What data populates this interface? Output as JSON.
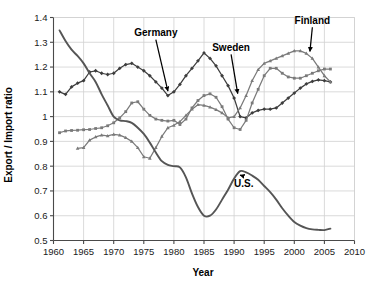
{
  "chart_data": {
    "type": "line",
    "title": "",
    "xlabel": "Year",
    "ylabel": "Export / Import ratio",
    "xlim": [
      1960,
      2010
    ],
    "ylim": [
      0.5,
      1.4
    ],
    "xticks": [
      1960,
      1965,
      1970,
      1975,
      1980,
      1985,
      1990,
      1995,
      2000,
      2005,
      2010
    ],
    "yticks": [
      0.5,
      0.6,
      0.7,
      0.8,
      0.9,
      1.0,
      1.1,
      1.2,
      1.3,
      1.4
    ],
    "xtick_labels": [
      "1960",
      "1965",
      "1970",
      "1975",
      "1980",
      "1985",
      "1990",
      "1995",
      "2000",
      "2005",
      "2010"
    ],
    "ytick_labels": [
      "0.5",
      "0.6",
      "0.7",
      "0.8",
      "0.9",
      "1",
      "1.1",
      "1.2",
      "1.3",
      "1.4"
    ],
    "grid": true,
    "legend_position": "none",
    "annotations": [
      {
        "label": "Germany",
        "x": 1979,
        "y": 1.085,
        "label_x": 1977.0,
        "label_y": 1.325
      },
      {
        "label": "Sweden",
        "x": 1990.6,
        "y": 1.075,
        "label_x": 1989.5,
        "label_y": 1.265
      },
      {
        "label": "Finland",
        "x": 2002.6,
        "y": 1.245,
        "label_x": 2003.0,
        "label_y": 1.375
      },
      {
        "label": "U.S.",
        "x": 1991.0,
        "y": 0.782,
        "label_x": 1991.6,
        "label_y": 0.715
      }
    ],
    "series": [
      {
        "name": "Germany",
        "color": "#3d3d3d",
        "marker": "diamond",
        "x": [
          1961,
          1962,
          1963,
          1964,
          1965,
          1966,
          1967,
          1968,
          1969,
          1970,
          1971,
          1972,
          1973,
          1974,
          1975,
          1976,
          1977,
          1978,
          1979,
          1980,
          1981,
          1982,
          1983,
          1984,
          1985,
          1986,
          1987,
          1988,
          1989,
          1990,
          1991,
          1992,
          1993,
          1994,
          1995,
          1996,
          1997,
          1998,
          1999,
          2000,
          2001,
          2002,
          2003,
          2004,
          2005,
          2006
        ],
        "y": [
          1.1,
          1.09,
          1.12,
          1.135,
          1.145,
          1.18,
          1.185,
          1.175,
          1.17,
          1.175,
          1.195,
          1.21,
          1.215,
          1.2,
          1.185,
          1.165,
          1.14,
          1.115,
          1.085,
          1.1,
          1.13,
          1.165,
          1.195,
          1.225,
          1.257,
          1.235,
          1.205,
          1.165,
          1.125,
          1.075,
          1.0,
          0.995,
          1.015,
          1.025,
          1.03,
          1.03,
          1.035,
          1.055,
          1.075,
          1.095,
          1.115,
          1.132,
          1.142,
          1.148,
          1.145,
          1.14
        ]
      },
      {
        "name": "Sweden",
        "color": "#7a7a7a",
        "marker": "square",
        "x": [
          1961,
          1962,
          1963,
          1964,
          1965,
          1966,
          1967,
          1968,
          1969,
          1970,
          1971,
          1972,
          1973,
          1974,
          1975,
          1976,
          1977,
          1978,
          1979,
          1980,
          1981,
          1982,
          1983,
          1984,
          1985,
          1986,
          1987,
          1988,
          1989,
          1990,
          1991,
          1992,
          1993,
          1994,
          1995,
          1996,
          1997,
          1998,
          1999,
          2000,
          2001,
          2002,
          2003,
          2004,
          2005,
          2006
        ],
        "y": [
          0.935,
          0.942,
          0.944,
          0.945,
          0.947,
          0.948,
          0.952,
          0.955,
          0.963,
          0.975,
          0.995,
          1.02,
          1.055,
          1.06,
          1.03,
          1.005,
          0.99,
          0.985,
          0.982,
          0.985,
          0.968,
          0.99,
          1.035,
          1.065,
          1.085,
          1.092,
          1.078,
          1.04,
          0.99,
          0.955,
          0.948,
          0.985,
          1.055,
          1.11,
          1.165,
          1.195,
          1.195,
          1.175,
          1.16,
          1.155,
          1.155,
          1.165,
          1.175,
          1.185,
          1.192,
          1.192
        ]
      },
      {
        "name": "Finland",
        "color": "#7a7a7a",
        "marker": "triangle",
        "x": [
          1964,
          1965,
          1966,
          1967,
          1968,
          1969,
          1970,
          1971,
          1972,
          1973,
          1974,
          1975,
          1976,
          1977,
          1978,
          1979,
          1980,
          1981,
          1982,
          1983,
          1984,
          1985,
          1986,
          1987,
          1988,
          1989,
          1990,
          1991,
          1992,
          1993,
          1994,
          1995,
          1996,
          1997,
          1998,
          1999,
          2000,
          2001,
          2002,
          2003,
          2004,
          2005,
          2006
        ],
        "y": [
          0.872,
          0.875,
          0.905,
          0.918,
          0.925,
          0.922,
          0.928,
          0.925,
          0.915,
          0.9,
          0.875,
          0.838,
          0.832,
          0.875,
          0.92,
          0.955,
          0.965,
          0.98,
          1.005,
          1.03,
          1.048,
          1.045,
          1.038,
          1.028,
          1.015,
          0.995,
          1.0,
          1.035,
          1.085,
          1.145,
          1.19,
          1.215,
          1.225,
          1.235,
          1.245,
          1.255,
          1.265,
          1.265,
          1.255,
          1.235,
          1.2,
          1.165,
          1.14
        ]
      },
      {
        "name": "U.S.",
        "color": "#555555",
        "marker": "none",
        "x": [
          1961,
          1962,
          1963,
          1964,
          1965,
          1966,
          1967,
          1968,
          1969,
          1970,
          1971,
          1972,
          1973,
          1974,
          1975,
          1976,
          1977,
          1978,
          1979,
          1980,
          1981,
          1982,
          1983,
          1984,
          1985,
          1986,
          1987,
          1988,
          1989,
          1990,
          1991,
          1992,
          1993,
          1994,
          1995,
          1996,
          1997,
          1998,
          1999,
          2000,
          2001,
          2002,
          2003,
          2004,
          2005,
          2006
        ],
        "y": [
          1.348,
          1.305,
          1.27,
          1.245,
          1.215,
          1.175,
          1.14,
          1.09,
          1.045,
          1.0,
          0.985,
          0.982,
          0.975,
          0.955,
          0.93,
          0.895,
          0.855,
          0.82,
          0.805,
          0.8,
          0.795,
          0.755,
          0.69,
          0.635,
          0.6,
          0.6,
          0.625,
          0.665,
          0.705,
          0.75,
          0.78,
          0.775,
          0.762,
          0.745,
          0.72,
          0.695,
          0.665,
          0.63,
          0.6,
          0.575,
          0.56,
          0.55,
          0.545,
          0.543,
          0.542,
          0.548
        ]
      }
    ]
  },
  "plot": {
    "background": "#ffffff",
    "grid_color": "#d0d0d0",
    "axis_color": "#4a4a4a"
  }
}
